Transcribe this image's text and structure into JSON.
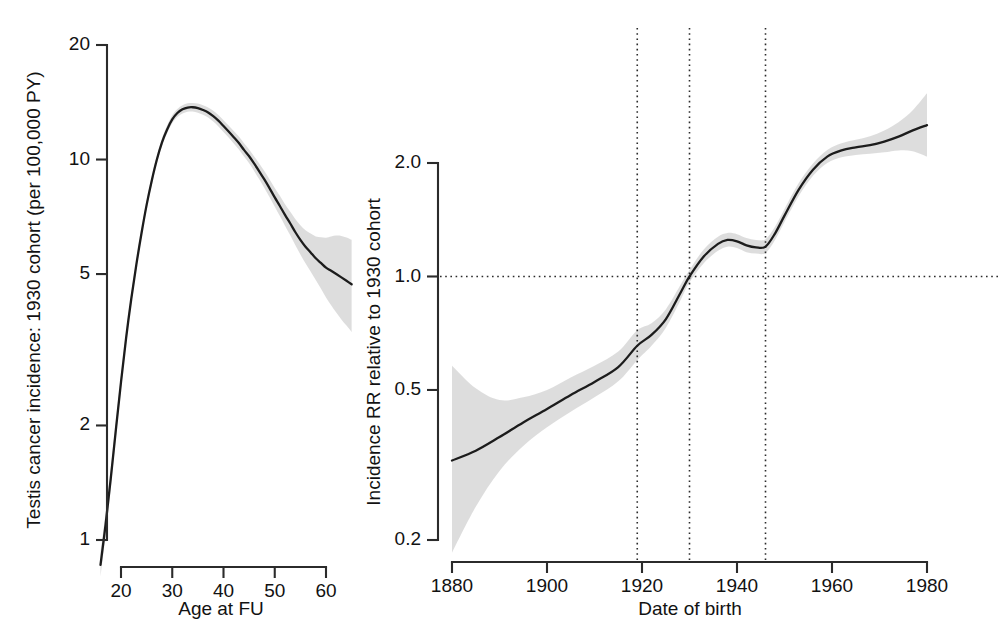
{
  "figure": {
    "title": "",
    "panels": [
      "left",
      "right"
    ]
  },
  "chart_data": [
    {
      "id": "left",
      "type": "line",
      "title": "",
      "xlabel": "Age at FU",
      "ylabel": "Testis cancer incidence: 1930 cohort (per 100,000 PY)",
      "xlim": [
        16,
        65
      ],
      "ylim": [
        0.85,
        21
      ],
      "yscale": "log",
      "xscale": "linear",
      "grid": false,
      "legend": null,
      "xticks": [
        20,
        30,
        40,
        50,
        60
      ],
      "xticklabels": [
        "20",
        "30",
        "40",
        "50",
        "60"
      ],
      "yticks": [
        1,
        2,
        5,
        10,
        20
      ],
      "yticklabels": [
        "1",
        "2",
        "5",
        "10",
        "20"
      ],
      "x": [
        16,
        17,
        18,
        19,
        20,
        21,
        22,
        23,
        24,
        25,
        26,
        27,
        28,
        29,
        30,
        31,
        32,
        33,
        34,
        35,
        36,
        37,
        38,
        39,
        40,
        41,
        42,
        43,
        44,
        45,
        46,
        47,
        48,
        49,
        50,
        51,
        52,
        53,
        54,
        55,
        56,
        57,
        58,
        59,
        60,
        61,
        62,
        63,
        64,
        65
      ],
      "y": [
        0.86,
        1.1,
        1.45,
        1.95,
        2.6,
        3.4,
        4.3,
        5.3,
        6.4,
        7.6,
        8.8,
        10.0,
        11.1,
        12.0,
        12.75,
        13.25,
        13.55,
        13.7,
        13.72,
        13.65,
        13.5,
        13.3,
        13.0,
        12.65,
        12.25,
        11.85,
        11.45,
        11.05,
        10.6,
        10.2,
        9.75,
        9.3,
        8.85,
        8.4,
        7.95,
        7.55,
        7.15,
        6.8,
        6.45,
        6.15,
        5.9,
        5.7,
        5.5,
        5.35,
        5.2,
        5.1,
        5.0,
        4.9,
        4.8,
        4.7
      ],
      "y_lower": [
        0.8,
        1.03,
        1.37,
        1.86,
        2.5,
        3.29,
        4.18,
        5.16,
        6.25,
        7.42,
        8.6,
        9.78,
        10.85,
        11.72,
        12.45,
        12.93,
        13.22,
        13.36,
        13.37,
        13.28,
        13.12,
        12.9,
        12.58,
        12.22,
        11.82,
        11.42,
        11.02,
        10.62,
        10.18,
        9.78,
        9.32,
        8.86,
        8.41,
        7.96,
        7.51,
        7.1,
        6.7,
        6.33,
        5.96,
        5.63,
        5.34,
        5.08,
        4.82,
        4.58,
        4.34,
        4.14,
        3.96,
        3.8,
        3.66,
        3.52
      ],
      "y_upper": [
        0.93,
        1.18,
        1.54,
        2.05,
        2.71,
        3.52,
        4.43,
        5.45,
        6.56,
        7.79,
        9.01,
        10.23,
        11.36,
        12.29,
        13.07,
        13.58,
        13.89,
        14.05,
        14.08,
        14.03,
        13.89,
        13.71,
        13.43,
        13.09,
        12.69,
        12.29,
        11.89,
        11.49,
        11.03,
        10.63,
        10.19,
        9.75,
        9.31,
        8.86,
        8.42,
        8.03,
        7.63,
        7.3,
        6.98,
        6.72,
        6.52,
        6.39,
        6.28,
        6.25,
        6.23,
        6.28,
        6.31,
        6.3,
        6.24,
        6.15
      ]
    },
    {
      "id": "right",
      "type": "line",
      "title": "",
      "xlabel": "Date of birth",
      "ylabel": "Incidence RR relative to 1930 cohort",
      "xlim": [
        1880,
        1981
      ],
      "ylim": [
        0.17,
        2.7
      ],
      "yscale": "log",
      "xscale": "linear",
      "grid": false,
      "legend": null,
      "xticks": [
        1880,
        1900,
        1920,
        1940,
        1960,
        1980
      ],
      "xticklabels": [
        "1880",
        "1900",
        "1920",
        "1940",
        "1960",
        "1980"
      ],
      "yticks": [
        0.2,
        0.5,
        1.0,
        2.0
      ],
      "yticklabels": [
        "0.2",
        "0.5",
        "1.0",
        "2.0"
      ],
      "reference_hline": 1.0,
      "event_vlines": [
        1919,
        1930,
        1946
      ],
      "x": [
        1880,
        1885,
        1890,
        1895,
        1900,
        1905,
        1910,
        1915,
        1919,
        1922,
        1925,
        1928,
        1930,
        1933,
        1936,
        1938,
        1940,
        1942,
        1944,
        1946,
        1948,
        1950,
        1953,
        1956,
        1959,
        1962,
        1965,
        1968,
        1971,
        1974,
        1977,
        1980
      ],
      "y": [
        0.325,
        0.345,
        0.375,
        0.41,
        0.445,
        0.485,
        0.525,
        0.575,
        0.655,
        0.7,
        0.77,
        0.9,
        1.0,
        1.13,
        1.22,
        1.25,
        1.24,
        1.21,
        1.195,
        1.2,
        1.3,
        1.45,
        1.7,
        1.92,
        2.08,
        2.16,
        2.2,
        2.23,
        2.28,
        2.35,
        2.44,
        2.52
      ],
      "y_lower": [
        0.185,
        0.245,
        0.305,
        0.355,
        0.398,
        0.438,
        0.478,
        0.527,
        0.6,
        0.655,
        0.73,
        0.86,
        0.965,
        1.085,
        1.17,
        1.2,
        1.19,
        1.16,
        1.15,
        1.155,
        1.25,
        1.395,
        1.635,
        1.85,
        2.0,
        2.07,
        2.1,
        2.115,
        2.135,
        2.16,
        2.15,
        2.08
      ],
      "y_upper": [
        0.58,
        0.505,
        0.47,
        0.478,
        0.5,
        0.54,
        0.58,
        0.632,
        0.72,
        0.752,
        0.818,
        0.945,
        1.04,
        1.18,
        1.275,
        1.305,
        1.295,
        1.265,
        1.25,
        1.255,
        1.355,
        1.51,
        1.77,
        1.995,
        2.165,
        2.255,
        2.305,
        2.355,
        2.44,
        2.565,
        2.76,
        3.06
      ]
    }
  ],
  "left_panel": {
    "y_axis_title": "Testis cancer incidence: 1930 cohort (per 100,000 PY)",
    "x_axis_title": "Age at FU",
    "y_ticks": [
      "20",
      "10",
      "5",
      "2",
      "1"
    ],
    "x_ticks": [
      "20",
      "30",
      "40",
      "50",
      "60"
    ]
  },
  "right_panel": {
    "y_axis_title": "Incidence RR relative to 1930 cohort",
    "x_axis_title": "Date of birth",
    "y_ticks": [
      "2.0",
      "1.0",
      "0.5",
      "0.2"
    ],
    "x_ticks": [
      "1880",
      "1900",
      "1920",
      "1940",
      "1960",
      "1980"
    ]
  },
  "colors": {
    "line": "#1c1c1c",
    "ci_band": "#d9d9d9",
    "axis": "#2b2b2b",
    "text": "#121212",
    "background": "#ffffff"
  }
}
